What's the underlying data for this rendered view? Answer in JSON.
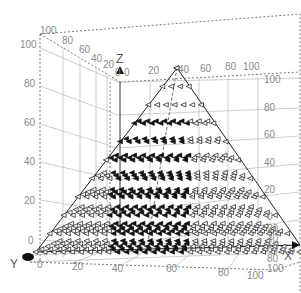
{
  "chart_data": {
    "type": "scatter",
    "subtype": "3d-cone-vector-field",
    "title": "",
    "axes": {
      "x": {
        "label": "X",
        "ticks": [
          0,
          20,
          40,
          60,
          80,
          100
        ],
        "range": [
          0,
          100
        ]
      },
      "y": {
        "label": "Y",
        "ticks": [
          0,
          20,
          40,
          60,
          80,
          100
        ],
        "range": [
          0,
          100
        ]
      },
      "z": {
        "label": "Z",
        "ticks": [
          0,
          20,
          40,
          60,
          80,
          100
        ],
        "range": [
          0,
          100
        ]
      }
    },
    "grid": true,
    "legend": null,
    "shape": "pyramid with apex at approx (33, 33, 100) and base spanning x 0-100 at z=0",
    "marker": "cone/arrow glyphs pointing left (toward -x), arranged on layers at z = 0, 10, 20, 30, 40, 50, 60, 70, 80, 90, 100",
    "layers_z": [
      0,
      10,
      20,
      30,
      40,
      50,
      60,
      70,
      80,
      90,
      100
    ]
  },
  "labels": {
    "x_axis": "X",
    "y_axis": "Y",
    "z_axis": "Z",
    "left_z_ticks": [
      "100",
      "80",
      "60",
      "40",
      "20",
      "0"
    ],
    "right_z_ticks": [
      "100",
      "80",
      "60",
      "40",
      "20",
      "0"
    ],
    "top_back_y_ticks": [
      "100",
      "80",
      "60",
      "40",
      "20",
      "0"
    ],
    "top_back_x_ticks": [
      "0",
      "20",
      "40",
      "60",
      "80",
      "100"
    ],
    "bottom_x_ticks": [
      "0",
      "20",
      "40",
      "60",
      "80",
      "100"
    ],
    "right_y_ticks": [
      "20",
      "40",
      "60",
      "80",
      "100"
    ]
  }
}
